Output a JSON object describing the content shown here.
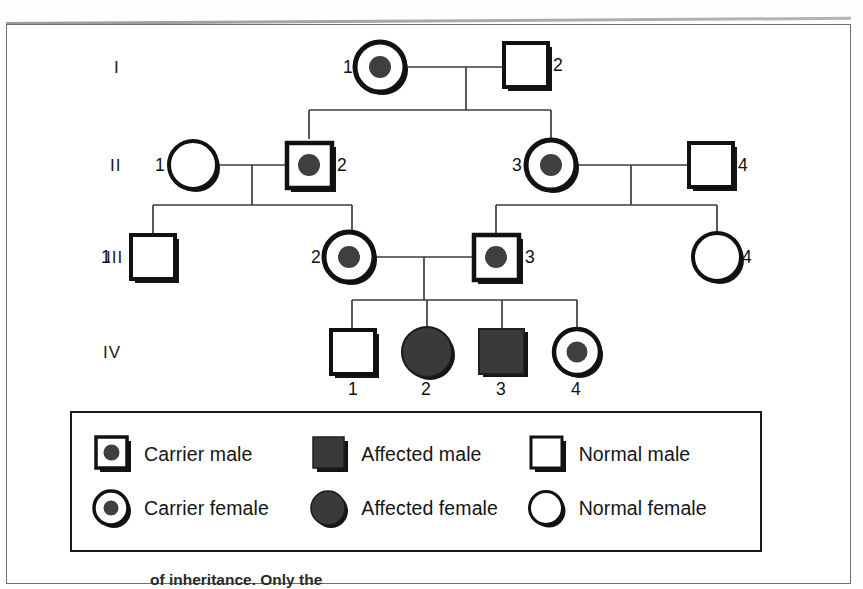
{
  "figure": {
    "type": "pedigree-chart",
    "caption_partial": "of inheritance. Only the"
  },
  "generations": [
    {
      "label": "I"
    },
    {
      "label": "II"
    },
    {
      "label": "III"
    },
    {
      "label": "IV"
    }
  ],
  "individuals": [
    {
      "gen": "I",
      "id": "1",
      "sex": "female",
      "status": "carrier",
      "label_side": "left"
    },
    {
      "gen": "I",
      "id": "2",
      "sex": "male",
      "status": "normal",
      "label_side": "right"
    },
    {
      "gen": "II",
      "id": "1",
      "sex": "female",
      "status": "normal",
      "label_side": "left"
    },
    {
      "gen": "II",
      "id": "2",
      "sex": "male",
      "status": "carrier",
      "label_side": "right"
    },
    {
      "gen": "II",
      "id": "3",
      "sex": "female",
      "status": "carrier",
      "label_side": "left"
    },
    {
      "gen": "II",
      "id": "4",
      "sex": "male",
      "status": "normal",
      "label_side": "right"
    },
    {
      "gen": "III",
      "id": "1",
      "sex": "male",
      "status": "normal",
      "label_side": "left"
    },
    {
      "gen": "III",
      "id": "2",
      "sex": "female",
      "status": "carrier",
      "label_side": "left"
    },
    {
      "gen": "III",
      "id": "3",
      "sex": "male",
      "status": "carrier",
      "label_side": "right"
    },
    {
      "gen": "III",
      "id": "4",
      "sex": "female",
      "status": "normal",
      "label_side": "right"
    },
    {
      "gen": "IV",
      "id": "1",
      "sex": "male",
      "status": "normal",
      "label_side": "below"
    },
    {
      "gen": "IV",
      "id": "2",
      "sex": "female",
      "status": "affected",
      "label_side": "below"
    },
    {
      "gen": "IV",
      "id": "3",
      "sex": "male",
      "status": "affected",
      "label_side": "below"
    },
    {
      "gen": "IV",
      "id": "4",
      "sex": "female",
      "status": "carrier",
      "label_side": "below"
    }
  ],
  "legend": {
    "items": [
      {
        "symbol": "carrier-male-symbol",
        "label": "Carrier male"
      },
      {
        "symbol": "affected-male-symbol",
        "label": "Affected male"
      },
      {
        "symbol": "normal-male-symbol",
        "label": "Normal male"
      },
      {
        "symbol": "carrier-female-symbol",
        "label": "Carrier female"
      },
      {
        "symbol": "affected-female-symbol",
        "label": "Affected female"
      },
      {
        "symbol": "normal-female-symbol",
        "label": "Normal female"
      }
    ]
  },
  "colors": {
    "stroke": "#111111",
    "fill_affected": "#3a3a3a",
    "fill_carrier_dot": "#3f3f3f",
    "fill_normal": "#ffffff",
    "line": "#3d3d3d",
    "shadow": "#141414"
  }
}
